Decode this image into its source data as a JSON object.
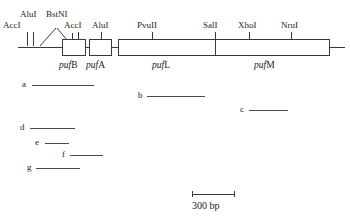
{
  "figure": {
    "type": "restriction-map",
    "width": 350,
    "height": 221,
    "background_color": "#ffffff",
    "line_color": "#3a3a3a",
    "text_color": "#1a1a1a"
  },
  "restriction_sites": [
    {
      "id": "site-accI-1",
      "label": "AccI",
      "label_x": 3,
      "label_y": 21,
      "tick_x": 27,
      "tick_y": 31,
      "tick_h": 10,
      "leader": "vertical"
    },
    {
      "id": "site-aluI-1",
      "label": "AluI",
      "label_x": 20,
      "label_y": 10,
      "tick_x": 31,
      "tick_y": 31,
      "tick_h": 10,
      "leader": "vertical"
    },
    {
      "id": "site-bstNI",
      "label": "BstNI",
      "label_x": 46,
      "label_y": 10,
      "tick_x": 62,
      "tick_y": 31,
      "tick_h": 8,
      "leader": "diagonal"
    },
    {
      "id": "site-accI-2",
      "label": "AccI",
      "label_x": 64,
      "label_y": 21,
      "tick_x": 75,
      "tick_y": 31,
      "tick_h": 8,
      "leader": "vertical"
    },
    {
      "id": "site-aluI-2",
      "label": "AluI",
      "label_x": 92,
      "label_y": 21,
      "tick_x": 101,
      "tick_y": 31,
      "tick_h": 8,
      "leader": "vertical"
    },
    {
      "id": "site-pvuII",
      "label": "PvuII",
      "label_x": 137,
      "label_y": 21,
      "tick_x": 152,
      "tick_y": 31,
      "tick_h": 8,
      "leader": "vertical"
    },
    {
      "id": "site-salI",
      "label": "SalI",
      "label_x": 203,
      "label_y": 21,
      "tick_x": 215,
      "tick_y": 31,
      "tick_h": 8,
      "leader": "vertical"
    },
    {
      "id": "site-xhoI",
      "label": "XhoI",
      "label_x": 238,
      "label_y": 21,
      "tick_x": 249,
      "tick_y": 31,
      "tick_h": 8,
      "leader": "vertical"
    },
    {
      "id": "site-nruI",
      "label": "NruI",
      "label_x": 281,
      "label_y": 21,
      "tick_x": 291,
      "tick_y": 31,
      "tick_h": 8,
      "leader": "vertical"
    }
  ],
  "genes": [
    {
      "id": "gene-pufB",
      "prefix": "puf",
      "suffix": "B",
      "box_x": 62,
      "box_y": 39,
      "box_w": 24,
      "box_h": 17,
      "label_x": 61,
      "label_y": 60
    },
    {
      "id": "gene-pufA",
      "prefix": "puf",
      "suffix": "A",
      "box_x": 89,
      "box_y": 39,
      "box_w": 23,
      "box_h": 17,
      "label_x": 88,
      "label_y": 60
    },
    {
      "id": "gene-pufL",
      "prefix": "puf",
      "suffix": "L",
      "box_x": 118,
      "box_y": 39,
      "box_w": 97,
      "box_h": 17,
      "label_x": 152,
      "label_y": 60
    },
    {
      "id": "gene-pufM",
      "prefix": "puf",
      "suffix": "M",
      "box_x": 215,
      "box_y": 39,
      "box_w": 115,
      "box_h": 17,
      "label_x": 256,
      "label_y": 60
    }
  ],
  "backbone_lines": [
    {
      "id": "backbone-left",
      "x": 18,
      "y": 47,
      "w": 44
    },
    {
      "id": "backbone-mid-1",
      "x": 86,
      "y": 47,
      "w": 3
    },
    {
      "id": "backbone-mid-2",
      "x": 112,
      "y": 47,
      "w": 6
    },
    {
      "id": "backbone-right",
      "x": 330,
      "y": 47,
      "w": 15
    }
  ],
  "fragments": [
    {
      "id": "fragment-a",
      "letter": "a",
      "label_x": 22,
      "label_y": 80,
      "line_x": 32,
      "line_y": 85,
      "line_w": 62
    },
    {
      "id": "fragment-b",
      "letter": "b",
      "label_x": 138,
      "label_y": 91,
      "line_x": 147,
      "line_y": 96,
      "line_w": 58
    },
    {
      "id": "fragment-c",
      "letter": "c",
      "label_x": 240,
      "label_y": 105,
      "line_x": 249,
      "line_y": 110,
      "line_w": 39
    },
    {
      "id": "fragment-d",
      "letter": "d",
      "label_x": 20,
      "label_y": 123,
      "line_x": 30,
      "line_y": 128,
      "line_w": 45
    },
    {
      "id": "fragment-e",
      "letter": "e",
      "label_x": 35,
      "label_y": 138,
      "line_x": 45,
      "line_y": 143,
      "line_w": 24
    },
    {
      "id": "fragment-f",
      "letter": "f",
      "label_x": 62,
      "label_y": 150,
      "line_x": 70,
      "line_y": 155,
      "line_w": 33
    },
    {
      "id": "fragment-g",
      "letter": "g",
      "label_x": 27,
      "label_y": 163,
      "line_x": 36,
      "line_y": 168,
      "line_w": 44
    }
  ],
  "scale": {
    "label": "300 bp",
    "bar_x": 192,
    "bar_y": 194,
    "bar_w": 42,
    "cap_h": 6,
    "label_x": 192,
    "label_y": 200
  }
}
